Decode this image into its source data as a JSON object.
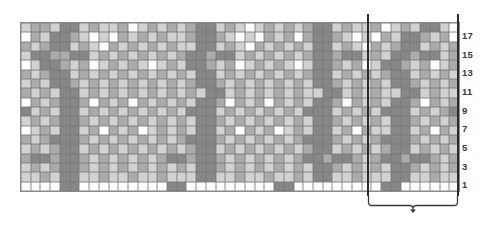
{
  "chart_data": {
    "type": "heatmap",
    "title": "",
    "xlabel": "",
    "ylabel": "",
    "grid": true,
    "legend_position": "none",
    "columns": 45,
    "rows": 18,
    "row_tick_labels": [
      "17",
      "15",
      "13",
      "11",
      "9",
      "7",
      "5",
      "3",
      "1"
    ],
    "row_tick_rows": [
      17,
      15,
      13,
      11,
      9,
      7,
      5,
      3,
      1
    ],
    "palette": {
      "0": "#ffffff",
      "1": "#d2d2d2",
      "2": "#ababab",
      "3": "#878787"
    },
    "palette_names": [
      "white",
      "light-gray",
      "medium-gray",
      "dark-gray"
    ],
    "repeat": {
      "label": "pattern repeat",
      "start_column": 36,
      "end_column": 45,
      "width_columns": 10
    },
    "values": [
      [
        1,
        2,
        2,
        1,
        3,
        3,
        1,
        2,
        1,
        1,
        2,
        0,
        1,
        2,
        1,
        2,
        1,
        2,
        3,
        3,
        1,
        2,
        1,
        0,
        1,
        2,
        1,
        2,
        1,
        2,
        3,
        3,
        1,
        2,
        1,
        1,
        2,
        0,
        1,
        2,
        1,
        3,
        3,
        1,
        0
      ],
      [
        0,
        2,
        1,
        3,
        3,
        2,
        1,
        0,
        1,
        0,
        2,
        1,
        2,
        1,
        2,
        1,
        1,
        2,
        3,
        3,
        2,
        1,
        0,
        1,
        0,
        2,
        1,
        2,
        0,
        2,
        3,
        3,
        2,
        1,
        0,
        1,
        0,
        2,
        1,
        3,
        3,
        2,
        1,
        2,
        0
      ],
      [
        2,
        1,
        2,
        3,
        3,
        1,
        2,
        1,
        0,
        2,
        1,
        2,
        1,
        2,
        1,
        2,
        1,
        1,
        3,
        3,
        1,
        2,
        1,
        0,
        2,
        1,
        2,
        1,
        2,
        1,
        3,
        3,
        1,
        2,
        1,
        0,
        2,
        1,
        2,
        3,
        3,
        1,
        2,
        1,
        2
      ],
      [
        1,
        3,
        3,
        2,
        2,
        3,
        3,
        1,
        2,
        1,
        2,
        1,
        2,
        1,
        2,
        1,
        2,
        3,
        3,
        2,
        3,
        3,
        1,
        2,
        1,
        2,
        1,
        2,
        1,
        2,
        3,
        3,
        2,
        3,
        3,
        1,
        2,
        1,
        3,
        3,
        2,
        3,
        3,
        1,
        2
      ],
      [
        0,
        1,
        3,
        3,
        2,
        1,
        2,
        0,
        1,
        2,
        1,
        2,
        1,
        0,
        1,
        2,
        1,
        3,
        3,
        2,
        1,
        2,
        0,
        1,
        2,
        1,
        2,
        1,
        0,
        1,
        3,
        3,
        2,
        1,
        2,
        0,
        1,
        3,
        3,
        2,
        1,
        2,
        0,
        1,
        2
      ],
      [
        2,
        1,
        2,
        3,
        3,
        1,
        2,
        1,
        2,
        1,
        2,
        1,
        2,
        1,
        2,
        1,
        2,
        1,
        3,
        3,
        1,
        2,
        1,
        2,
        1,
        2,
        1,
        2,
        1,
        2,
        3,
        3,
        1,
        2,
        1,
        2,
        1,
        2,
        3,
        3,
        1,
        2,
        1,
        2,
        1
      ],
      [
        1,
        2,
        1,
        3,
        3,
        2,
        1,
        2,
        1,
        2,
        1,
        2,
        1,
        2,
        1,
        2,
        1,
        2,
        3,
        3,
        2,
        1,
        2,
        1,
        2,
        1,
        2,
        1,
        2,
        1,
        3,
        3,
        2,
        1,
        2,
        1,
        2,
        1,
        3,
        3,
        2,
        1,
        2,
        1,
        2
      ],
      [
        2,
        1,
        2,
        1,
        3,
        3,
        1,
        2,
        1,
        2,
        1,
        2,
        1,
        2,
        1,
        2,
        1,
        2,
        1,
        3,
        3,
        1,
        2,
        1,
        2,
        1,
        2,
        1,
        2,
        1,
        1,
        3,
        3,
        1,
        2,
        1,
        2,
        1,
        1,
        3,
        3,
        1,
        2,
        1,
        1
      ],
      [
        0,
        2,
        1,
        2,
        3,
        3,
        2,
        0,
        2,
        1,
        2,
        0,
        2,
        1,
        2,
        1,
        2,
        1,
        3,
        3,
        2,
        0,
        2,
        1,
        2,
        0,
        2,
        1,
        2,
        1,
        3,
        3,
        2,
        0,
        2,
        1,
        2,
        1,
        3,
        3,
        2,
        0,
        2,
        1,
        2
      ],
      [
        3,
        1,
        2,
        1,
        3,
        3,
        1,
        2,
        1,
        2,
        1,
        2,
        1,
        2,
        1,
        2,
        1,
        3,
        3,
        3,
        1,
        2,
        1,
        2,
        1,
        2,
        1,
        2,
        1,
        3,
        3,
        3,
        1,
        2,
        1,
        2,
        1,
        3,
        3,
        3,
        1,
        2,
        1,
        2,
        3
      ],
      [
        1,
        2,
        1,
        2,
        3,
        3,
        2,
        1,
        2,
        1,
        2,
        1,
        2,
        1,
        2,
        1,
        2,
        1,
        3,
        3,
        2,
        1,
        2,
        1,
        2,
        1,
        2,
        1,
        2,
        1,
        3,
        3,
        2,
        1,
        2,
        1,
        2,
        1,
        3,
        3,
        2,
        1,
        2,
        1,
        2
      ],
      [
        0,
        1,
        2,
        1,
        3,
        3,
        1,
        2,
        0,
        2,
        1,
        2,
        0,
        1,
        2,
        1,
        2,
        1,
        3,
        3,
        1,
        2,
        0,
        2,
        1,
        2,
        0,
        1,
        2,
        1,
        3,
        3,
        1,
        2,
        0,
        2,
        1,
        1,
        3,
        3,
        1,
        2,
        0,
        2,
        1
      ],
      [
        2,
        1,
        2,
        3,
        3,
        3,
        2,
        1,
        2,
        1,
        2,
        1,
        2,
        1,
        2,
        1,
        2,
        3,
        3,
        3,
        2,
        1,
        2,
        1,
        2,
        1,
        2,
        1,
        2,
        3,
        3,
        3,
        2,
        1,
        2,
        1,
        2,
        3,
        3,
        3,
        2,
        1,
        2,
        1,
        2
      ],
      [
        1,
        2,
        1,
        2,
        3,
        3,
        1,
        2,
        1,
        2,
        1,
        2,
        1,
        2,
        1,
        2,
        1,
        2,
        3,
        3,
        1,
        2,
        1,
        2,
        1,
        2,
        1,
        2,
        1,
        2,
        3,
        3,
        1,
        2,
        1,
        2,
        1,
        2,
        3,
        3,
        1,
        2,
        1,
        2,
        1
      ],
      [
        2,
        3,
        3,
        2,
        3,
        3,
        2,
        1,
        2,
        1,
        2,
        1,
        2,
        1,
        2,
        3,
        3,
        2,
        3,
        3,
        2,
        1,
        2,
        1,
        2,
        1,
        2,
        1,
        2,
        3,
        3,
        2,
        3,
        3,
        2,
        1,
        2,
        3,
        3,
        2,
        3,
        3,
        2,
        1,
        2
      ],
      [
        1,
        2,
        1,
        2,
        3,
        3,
        2,
        1,
        2,
        1,
        2,
        1,
        2,
        1,
        2,
        1,
        2,
        1,
        3,
        3,
        2,
        1,
        2,
        1,
        2,
        1,
        2,
        1,
        2,
        1,
        3,
        3,
        2,
        1,
        2,
        1,
        2,
        1,
        3,
        3,
        2,
        1,
        2,
        1,
        2
      ],
      [
        1,
        1,
        2,
        1,
        3,
        3,
        1,
        1,
        2,
        1,
        1,
        2,
        1,
        1,
        2,
        1,
        1,
        1,
        3,
        3,
        1,
        1,
        2,
        1,
        1,
        2,
        1,
        1,
        2,
        1,
        3,
        3,
        1,
        1,
        2,
        1,
        1,
        1,
        3,
        3,
        1,
        1,
        2,
        1,
        1
      ],
      [
        0,
        0,
        0,
        0,
        3,
        3,
        0,
        0,
        0,
        0,
        0,
        0,
        0,
        0,
        0,
        3,
        3,
        0,
        0,
        0,
        0,
        0,
        0,
        0,
        0,
        0,
        3,
        3,
        0,
        0,
        0,
        0,
        0,
        0,
        0,
        0,
        0,
        3,
        3,
        0,
        0,
        0,
        0,
        0,
        0
      ]
    ]
  }
}
